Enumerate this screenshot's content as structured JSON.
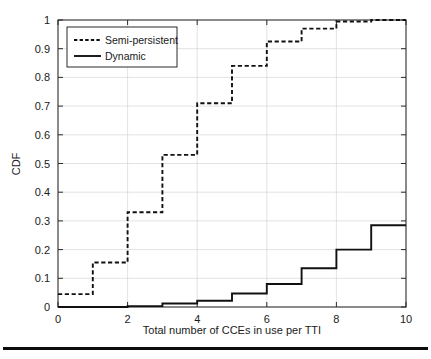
{
  "figure": {
    "background_color": "#ffffff",
    "axis_color": "#2b2b2b",
    "grid_color": "#cfcfcf",
    "line_color": "#111111"
  },
  "axes": {
    "x_title": "Total number of CCEs in use per TTI",
    "y_title": "CDF",
    "x_ticks": [
      "0",
      "2",
      "4",
      "6",
      "8",
      "10"
    ],
    "y_ticks": [
      "0",
      "0.1",
      "0.2",
      "0.3",
      "0.4",
      "0.5",
      "0.6",
      "0.7",
      "0.8",
      "0.9",
      "1"
    ]
  },
  "legend": {
    "items": [
      {
        "label": "Semi-persistent",
        "style": "dashed"
      },
      {
        "label": "Dynamic",
        "style": "solid"
      }
    ]
  },
  "footer": {
    "rule": ""
  },
  "chart_data": {
    "type": "line",
    "title": "",
    "subtitle": "",
    "xlabel": "Total number of CCEs in use per TTI",
    "ylabel": "CDF",
    "xlim": [
      0,
      10
    ],
    "ylim": [
      0,
      1
    ],
    "xticks": [
      0,
      2,
      4,
      6,
      8,
      10
    ],
    "yticks": [
      0,
      0.1,
      0.2,
      0.3,
      0.4,
      0.5,
      0.6,
      0.7,
      0.8,
      0.9,
      1
    ],
    "grid": true,
    "legend_position": "upper-left",
    "step_style": "post",
    "x": [
      0,
      1,
      2,
      3,
      4,
      5,
      6,
      7,
      8,
      9,
      10
    ],
    "series": [
      {
        "name": "Semi-persistent",
        "style": "dashed",
        "color": "#111111",
        "values": [
          0.045,
          0.155,
          0.33,
          0.53,
          0.71,
          0.84,
          0.925,
          0.97,
          0.995,
          1.0,
          1.0
        ]
      },
      {
        "name": "Dynamic",
        "style": "solid",
        "color": "#111111",
        "values": [
          0.0,
          0.0,
          0.003,
          0.012,
          0.022,
          0.047,
          0.08,
          0.135,
          0.2,
          0.285,
          0.285
        ]
      }
    ]
  }
}
